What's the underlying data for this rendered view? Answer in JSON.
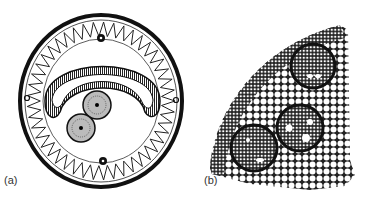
{
  "figure": {
    "panels": [
      {
        "id": "a",
        "label": "(a)",
        "subject": "circular cross-section with crescent-shaped central canal, two radial bundles, and folded peripheral band",
        "outer_ring": {
          "cx": 101,
          "cy": 101,
          "rx": 83,
          "ry": 88
        },
        "crescent": {
          "description": "U-shaped striated band"
        },
        "bundles": [
          {
            "cx": 97,
            "cy": 105,
            "r": 15
          },
          {
            "cx": 81,
            "cy": 128,
            "r": 15
          }
        ],
        "top_node": {
          "cx": 101,
          "cy": 38
        },
        "bottom_node": {
          "cx": 103,
          "cy": 161
        },
        "side_nodes": [
          {
            "cx": 26,
            "cy": 98
          },
          {
            "cx": 176,
            "cy": 100
          }
        ]
      },
      {
        "id": "b",
        "label": "(b)",
        "subject": "wedge of stem cross-section showing parenchyma cells and three vascular bundles",
        "bundles": [
          {
            "cx": 123,
            "cy": 66,
            "r": 22
          },
          {
            "cx": 110,
            "cy": 128,
            "r": 23
          },
          {
            "cx": 64,
            "cy": 148,
            "r": 23
          }
        ]
      }
    ]
  },
  "colors": {
    "ink": "#111111",
    "paper": "#ffffff"
  }
}
